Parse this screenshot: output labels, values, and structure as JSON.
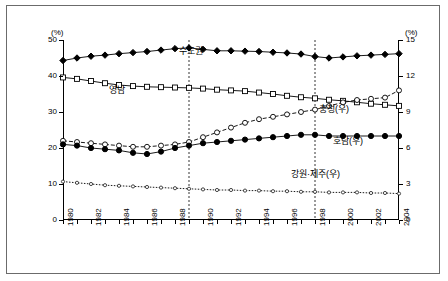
{
  "chart_data": {
    "type": "line",
    "title": "",
    "xlabel": "",
    "ylabel_left": "(%)",
    "ylabel_right": "(%)",
    "x": [
      1980,
      1981,
      1982,
      1983,
      1984,
      1985,
      1986,
      1987,
      1988,
      1989,
      1990,
      1991,
      1992,
      1993,
      1994,
      1995,
      1996,
      1997,
      1998,
      1999,
      2000,
      2001,
      2002,
      2003,
      2004
    ],
    "xtick_labels": [
      "1980",
      "1982",
      "1984",
      "1986",
      "1988",
      "1990",
      "1992",
      "1994",
      "1996",
      "1998",
      "2000",
      "2002",
      "2004"
    ],
    "ylim_left": [
      0,
      50
    ],
    "ytick_labels_left": [
      "0",
      "10",
      "20",
      "30",
      "40",
      "50"
    ],
    "ylim_right": [
      0,
      15
    ],
    "ytick_labels_right": [
      "0",
      "3",
      "6",
      "9",
      "12",
      "15"
    ],
    "grid": false,
    "legend_position": "inline-annotations",
    "annotations": [
      {
        "text": "수도권",
        "x": 1988,
        "y": 47.2,
        "axis": "left"
      },
      {
        "text": "영남",
        "x": 1983,
        "y": 36.5,
        "axis": "left"
      },
      {
        "text": "충청(우)",
        "x": 1998,
        "y": 31.0,
        "axis": "left"
      },
      {
        "text": "호남(우)",
        "x": 1999,
        "y": 22.3,
        "axis": "left"
      },
      {
        "text": "강원·제주(우)",
        "x": 1996,
        "y": 13.0,
        "axis": "left"
      }
    ],
    "vertical_reference_lines": [
      1989,
      1998
    ],
    "series": [
      {
        "name": "수도권",
        "axis": "left",
        "marker": "filled-diamond",
        "values": [
          44.3,
          45.0,
          45.5,
          45.8,
          46.2,
          46.5,
          46.8,
          47.2,
          47.6,
          47.8,
          47.4,
          47.0,
          47.0,
          46.9,
          46.8,
          46.6,
          46.4,
          46.1,
          45.4,
          45.0,
          45.3,
          45.6,
          45.8,
          46.0,
          46.2
        ]
      },
      {
        "name": "영남",
        "axis": "left",
        "marker": "open-square",
        "values": [
          39.6,
          39.2,
          38.6,
          38.0,
          37.5,
          37.2,
          37.0,
          36.9,
          36.8,
          36.7,
          36.5,
          36.2,
          36.0,
          35.8,
          35.4,
          35.0,
          34.5,
          34.1,
          33.8,
          33.4,
          33.1,
          32.7,
          32.3,
          32.0,
          31.7
        ]
      },
      {
        "name": "충청(우)",
        "axis": "right",
        "marker": "open-circle-dashed",
        "values": [
          6.6,
          6.5,
          6.4,
          6.3,
          6.2,
          6.1,
          6.1,
          6.2,
          6.3,
          6.5,
          6.9,
          7.3,
          7.7,
          8.1,
          8.4,
          8.6,
          8.8,
          9.0,
          9.2,
          9.5,
          9.8,
          10.0,
          10.1,
          10.2,
          10.8
        ]
      },
      {
        "name": "호남(우)",
        "axis": "right",
        "marker": "filled-circle",
        "values": [
          6.3,
          6.2,
          6.0,
          5.9,
          5.8,
          5.6,
          5.5,
          5.7,
          6.0,
          6.2,
          6.4,
          6.5,
          6.6,
          6.7,
          6.8,
          6.9,
          7.0,
          7.1,
          7.1,
          7.0,
          7.0,
          7.0,
          7.0,
          7.0,
          7.0
        ]
      },
      {
        "name": "강원·제주(우)",
        "axis": "right",
        "marker": "small-open-circle-dotted",
        "values": [
          3.2,
          3.1,
          3.0,
          2.9,
          2.85,
          2.8,
          2.75,
          2.7,
          2.65,
          2.6,
          2.55,
          2.5,
          2.5,
          2.45,
          2.45,
          2.4,
          2.4,
          2.35,
          2.35,
          2.3,
          2.3,
          2.3,
          2.25,
          2.25,
          2.2
        ]
      }
    ]
  },
  "axes": {
    "left_unit": "(%)",
    "right_unit": "(%)"
  }
}
